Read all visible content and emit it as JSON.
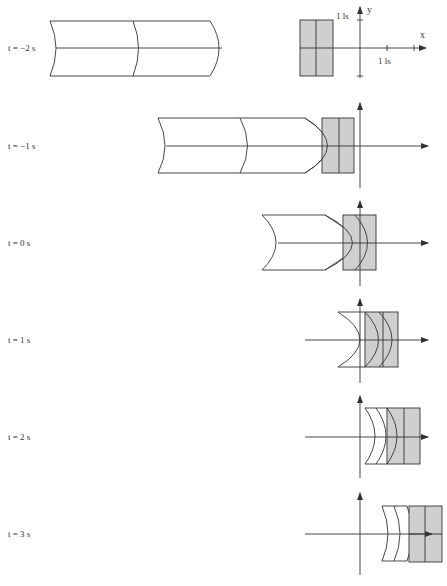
{
  "figure": {
    "rows": [
      {
        "label": "t = −2 s"
      },
      {
        "label": "t = −1 s"
      },
      {
        "label": "t = 0 s"
      },
      {
        "label": "t = 1 s"
      },
      {
        "label": "t = 2 s"
      },
      {
        "label": "t = 3 s"
      }
    ],
    "axes": {
      "x_label": "x",
      "y_label": "y",
      "x_tick_label": "1 ls",
      "y_tick_label": "1 ls"
    },
    "colors": {
      "line": "#333333",
      "shaded": "#cfcfcf",
      "background": "#ffffff"
    }
  }
}
